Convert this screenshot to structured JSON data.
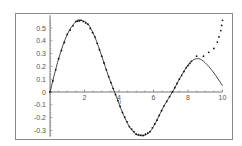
{
  "chart_data": {
    "type": "line",
    "title": "",
    "xlabel": "t",
    "ylabel": "",
    "xlim": [
      0,
      10
    ],
    "ylim": [
      -0.35,
      0.6
    ],
    "x_ticks": [
      2,
      4,
      6,
      8,
      10
    ],
    "x_tick_labels": [
      "2",
      "4",
      "6",
      "8",
      "10"
    ],
    "y_ticks": [
      -0.3,
      -0.2,
      -0.1,
      0,
      0.1,
      0.2,
      0.3,
      0.4,
      0.5
    ],
    "y_tick_labels": [
      "-0.3",
      "-0.2",
      "-0.1",
      "0",
      "0.1",
      "0.2",
      "0.3",
      "0.4",
      "0.5"
    ],
    "grid": false,
    "legend": null,
    "series": [
      {
        "name": "solution",
        "style": "solid",
        "color": "#333333",
        "x": [
          0,
          0.5,
          1,
          1.5,
          1.8,
          2.2,
          2.6,
          3,
          3.4,
          3.8,
          4.2,
          4.6,
          5,
          5.4,
          5.8,
          6.2,
          6.6,
          7.1,
          7.5,
          7.9,
          8.2,
          8.5,
          8.8,
          9.2,
          9.6,
          10
        ],
        "y": [
          0,
          0.26,
          0.45,
          0.55,
          0.56,
          0.53,
          0.43,
          0.28,
          0.12,
          -0.02,
          -0.16,
          -0.27,
          -0.33,
          -0.34,
          -0.31,
          -0.22,
          -0.11,
          0.0,
          0.1,
          0.19,
          0.24,
          0.26,
          0.25,
          0.2,
          0.13,
          0.05
        ]
      },
      {
        "name": "approximation",
        "style": "dotted",
        "color": "#111111",
        "x": [
          0,
          0.5,
          1,
          1.5,
          1.8,
          2.2,
          2.6,
          3,
          3.4,
          3.8,
          4.2,
          4.6,
          5,
          5.4,
          5.8,
          6.2,
          6.6,
          7.1,
          7.5,
          7.9,
          8.2,
          8.5,
          8.9,
          9.2,
          9.5,
          9.7,
          9.8,
          9.9,
          9.95,
          10
        ],
        "y": [
          0,
          0.26,
          0.45,
          0.55,
          0.56,
          0.53,
          0.43,
          0.28,
          0.12,
          -0.02,
          -0.16,
          -0.27,
          -0.33,
          -0.34,
          -0.31,
          -0.22,
          -0.11,
          0.0,
          0.1,
          0.19,
          0.24,
          0.28,
          0.28,
          0.31,
          0.34,
          0.39,
          0.43,
          0.48,
          0.52,
          0.56
        ]
      }
    ]
  },
  "frame": {
    "left": 15,
    "top": 13,
    "right": 232,
    "bottom": 139
  },
  "plot": {
    "x0_px": 50,
    "px_per_x": 17.25,
    "y0_px": 92,
    "px_per_y": 128
  }
}
